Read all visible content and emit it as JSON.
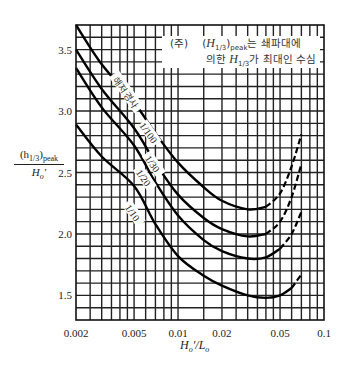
{
  "chart_data": {
    "type": "line",
    "title": "",
    "xlabel": "H_o'/L_o",
    "ylabel": "(h_1/3)_peak / H_o'",
    "xscale": "log",
    "xlim": [
      0.002,
      0.1
    ],
    "ylim": [
      1.3,
      3.7
    ],
    "grid": true,
    "x_ticks": [
      "0.002",
      "0.005",
      "0.01",
      "0.02",
      "0.05",
      "0.1"
    ],
    "y_ticks": [
      "1.5",
      "2.0",
      "2.5",
      "3.0",
      "3.5"
    ],
    "legend_title": "해저경사",
    "annotation": {
      "prefix": "(주)",
      "line1_math": "H",
      "line1_sub": "1/3",
      "line1_sub2": "peak",
      "line1_text": "는 쇄파대에",
      "line2_pre": "의한 ",
      "line2_math": "H",
      "line2_sub": "1/3",
      "line2_text": "가 최대인 수심"
    },
    "series": [
      {
        "name": "1/100",
        "x": [
          0.002,
          0.003,
          0.005,
          0.007,
          0.01,
          0.015,
          0.02,
          0.03,
          0.04,
          0.05,
          0.06,
          0.07
        ],
        "y": [
          3.7,
          3.38,
          3.07,
          2.82,
          2.58,
          2.38,
          2.27,
          2.2,
          2.22,
          2.33,
          2.55,
          2.81
        ],
        "dashed_from": 0.04
      },
      {
        "name": "1/30",
        "x": [
          0.002,
          0.003,
          0.005,
          0.007,
          0.01,
          0.015,
          0.02,
          0.03,
          0.04,
          0.05,
          0.06,
          0.07
        ],
        "y": [
          3.5,
          3.18,
          2.86,
          2.58,
          2.32,
          2.13,
          2.04,
          1.98,
          2.0,
          2.1,
          2.3,
          2.57
        ],
        "dashed_from": 0.04
      },
      {
        "name": "1/20",
        "x": [
          0.002,
          0.003,
          0.005,
          0.007,
          0.01,
          0.015,
          0.02,
          0.03,
          0.04,
          0.05,
          0.06,
          0.07
        ],
        "y": [
          3.35,
          3.03,
          2.72,
          2.42,
          2.15,
          1.95,
          1.86,
          1.8,
          1.81,
          1.88,
          2.0,
          2.18
        ],
        "dashed_from": 0.045
      },
      {
        "name": "1/10",
        "x": [
          0.002,
          0.003,
          0.005,
          0.007,
          0.01,
          0.015,
          0.02,
          0.03,
          0.04,
          0.05,
          0.06,
          0.07
        ],
        "y": [
          2.89,
          2.63,
          2.39,
          2.08,
          1.82,
          1.66,
          1.58,
          1.5,
          1.48,
          1.5,
          1.56,
          1.67
        ],
        "dashed_from": 0.055
      }
    ]
  },
  "axis": {
    "x_label_main": "H",
    "x_label_sub1": "o",
    "x_label_mid": "′/L",
    "x_label_sub2": "o",
    "y_label_num_pre": "(h",
    "y_label_num_sub": "1/3",
    "y_label_num_mid": ")",
    "y_label_num_sub2": "peak",
    "y_label_den": "H",
    "y_label_den_sub": "o",
    "y_label_den_post": "′"
  }
}
